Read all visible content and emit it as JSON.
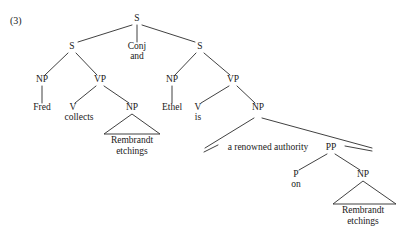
{
  "figure": {
    "example_number": "(3)",
    "caption": ""
  },
  "nodes": [
    {
      "id": "S_root",
      "label": "S",
      "x": 137,
      "y": 21
    },
    {
      "id": "S_left",
      "label": "S",
      "x": 72,
      "y": 49
    },
    {
      "id": "Conj",
      "label": "Conj",
      "x": 137,
      "y": 49
    },
    {
      "id": "and",
      "label": "and",
      "x": 137,
      "y": 59
    },
    {
      "id": "S_right",
      "label": "S",
      "x": 200,
      "y": 49
    },
    {
      "id": "NP_fred",
      "label": "NP",
      "x": 42,
      "y": 82
    },
    {
      "id": "VP_left",
      "label": "VP",
      "x": 100,
      "y": 82
    },
    {
      "id": "NP_ethel",
      "label": "NP",
      "x": 172,
      "y": 82
    },
    {
      "id": "VP_right",
      "label": "VP",
      "x": 233,
      "y": 82
    },
    {
      "id": "Fred",
      "label": "Fred",
      "x": 42,
      "y": 110
    },
    {
      "id": "V_coll",
      "label": "V",
      "x": 73,
      "y": 110
    },
    {
      "id": "collects",
      "label": "collects",
      "x": 79,
      "y": 120
    },
    {
      "id": "NP_rem1",
      "label": "NP",
      "x": 132,
      "y": 110
    },
    {
      "id": "Ethel",
      "label": "Ethel",
      "x": 172,
      "y": 110
    },
    {
      "id": "V_is",
      "label": "V",
      "x": 198,
      "y": 110
    },
    {
      "id": "is",
      "label": "is",
      "x": 198,
      "y": 120
    },
    {
      "id": "NP_auth",
      "label": "NP",
      "x": 258,
      "y": 110
    },
    {
      "id": "auth_text",
      "label": "a renowned authority",
      "x": 268,
      "y": 150
    },
    {
      "id": "PP",
      "label": "PP",
      "x": 331,
      "y": 150
    },
    {
      "id": "P",
      "label": "P",
      "x": 296,
      "y": 177
    },
    {
      "id": "on",
      "label": "on",
      "x": 296,
      "y": 187
    },
    {
      "id": "NP_rem2",
      "label": "NP",
      "x": 363,
      "y": 177
    },
    {
      "id": "rem1_line1",
      "label": "Rembrandt",
      "x": 132,
      "y": 143
    },
    {
      "id": "rem1_line2",
      "label": "etchings",
      "x": 132,
      "y": 154
    },
    {
      "id": "rem2_line1",
      "label": "Rembrandt",
      "x": 363,
      "y": 213
    },
    {
      "id": "rem2_line2",
      "label": "etchings",
      "x": 363,
      "y": 224
    }
  ],
  "edges": [
    {
      "id": "root-to-sleft",
      "x1": 132,
      "y1": 25,
      "x2": 78,
      "y2": 42
    },
    {
      "id": "root-to-conj",
      "x1": 137,
      "y1": 25,
      "x2": 137,
      "y2": 42
    },
    {
      "id": "root-to-sright",
      "x1": 142,
      "y1": 25,
      "x2": 195,
      "y2": 42
    },
    {
      "id": "sleft-to-np",
      "x1": 68,
      "y1": 53,
      "x2": 45,
      "y2": 75
    },
    {
      "id": "sleft-to-vp",
      "x1": 76,
      "y1": 53,
      "x2": 97,
      "y2": 75
    },
    {
      "id": "sright-to-np",
      "x1": 196,
      "y1": 53,
      "x2": 175,
      "y2": 75
    },
    {
      "id": "sright-to-vp",
      "x1": 204,
      "y1": 53,
      "x2": 230,
      "y2": 75
    },
    {
      "id": "np-to-fred",
      "x1": 42,
      "y1": 86,
      "x2": 42,
      "y2": 103
    },
    {
      "id": "vpleft-to-v",
      "x1": 96,
      "y1": 86,
      "x2": 75,
      "y2": 103
    },
    {
      "id": "vpleft-to-np",
      "x1": 104,
      "y1": 86,
      "x2": 129,
      "y2": 103
    },
    {
      "id": "np-to-ethel",
      "x1": 172,
      "y1": 86,
      "x2": 172,
      "y2": 103
    },
    {
      "id": "vpright-to-v",
      "x1": 229,
      "y1": 86,
      "x2": 201,
      "y2": 103
    },
    {
      "id": "vpright-to-np",
      "x1": 237,
      "y1": 86,
      "x2": 255,
      "y2": 103
    },
    {
      "id": "npauth-to-text",
      "x1": 254,
      "y1": 118,
      "x2": 205,
      "y2": 148
    },
    {
      "id": "npauth-to-pp",
      "x1": 262,
      "y1": 118,
      "x2": 372,
      "y2": 148
    },
    {
      "id": "pp-to-p",
      "x1": 327,
      "y1": 154,
      "x2": 299,
      "y2": 170
    },
    {
      "id": "pp-to-np",
      "x1": 335,
      "y1": 154,
      "x2": 360,
      "y2": 170
    }
  ],
  "triangles": [
    {
      "id": "triangle-rembrandt-etchings-1",
      "apex_x": 132,
      "apex_y": 114,
      "left_x": 104,
      "right_x": 160,
      "base_y": 134
    },
    {
      "id": "triangle-rembrandt-etchings-2",
      "apex_x": 363,
      "apex_y": 181,
      "left_x": 333,
      "right_x": 396,
      "base_y": 204
    }
  ],
  "wedges": [
    {
      "id": "wedge-a-renowned-authority",
      "x1": 204,
      "y1": 152,
      "x2": 218,
      "y2": 145
    },
    {
      "id": "wedge-pp-right",
      "x1": 345,
      "y1": 146,
      "x2": 372,
      "y2": 151
    }
  ]
}
